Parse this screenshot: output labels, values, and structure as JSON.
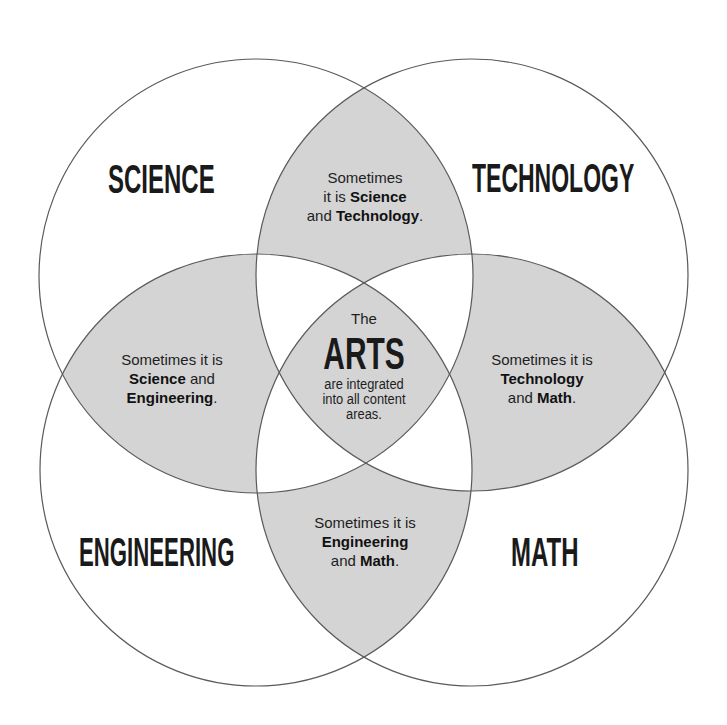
{
  "diagram": {
    "type": "venn",
    "colors": {
      "background": "#ffffff",
      "overlap_fill": "#d4d4d4",
      "stroke": "#5a5a5a",
      "text": "#1a1a1a"
    },
    "circles": [
      {
        "id": "science",
        "label": "SCIENCE",
        "cx": 256,
        "cy": 276,
        "r": 217
      },
      {
        "id": "technology",
        "label": "TECHNOLOGY",
        "cx": 472,
        "cy": 275,
        "r": 216
      },
      {
        "id": "engineering",
        "label": "ENGINEERING",
        "cx": 256,
        "cy": 470,
        "r": 216
      },
      {
        "id": "math",
        "label": "MATH",
        "cx": 472,
        "cy": 470,
        "r": 216
      }
    ],
    "labels": {
      "science": "SCIENCE",
      "technology": "TECHNOLOGY",
      "engineering": "ENGINEERING",
      "math": "MATH"
    },
    "overlaps": {
      "science_technology": {
        "line1": "Sometimes",
        "line2_pre": "it is ",
        "line2_bold": "Science",
        "line3_pre": "and ",
        "line3_bold": "Technology",
        "line3_post": "."
      },
      "science_engineering": {
        "line1": "Sometimes it is",
        "line2_bold": "Science",
        "line2_post": " and",
        "line3_bold": "Engineering",
        "line3_post": "."
      },
      "technology_math": {
        "line1": "Sometimes it is",
        "line2_bold": "Technology",
        "line3_pre": "and ",
        "line3_bold": "Math",
        "line3_post": "."
      },
      "engineering_math": {
        "line1": "Sometimes it is",
        "line2_bold": "Engineering",
        "line3_pre": "and ",
        "line3_bold": "Math",
        "line3_post": "."
      }
    },
    "center": {
      "pre": "The",
      "title": "ARTS",
      "line1": "are integrated",
      "line2": "into all content",
      "line3": "areas."
    }
  }
}
